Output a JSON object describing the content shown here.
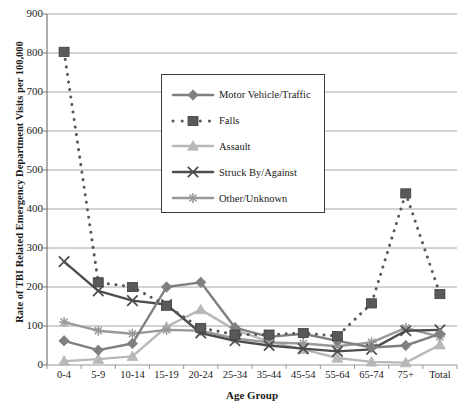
{
  "chart_data": {
    "type": "line",
    "title": "",
    "xlabel": "Age Group",
    "ylabel": "Rate of TBI Related Emergency Department Visits per 100,000",
    "ylim": [
      0,
      900
    ],
    "ytick_step": 100,
    "yticks": [
      "900",
      "800",
      "700",
      "600",
      "500",
      "400",
      "300",
      "200",
      "100",
      "0"
    ],
    "grid": "horizontal",
    "legend_position": "upper-center",
    "categories": [
      "0-4",
      "5-9",
      "10-14",
      "15-19",
      "20-24",
      "25-34",
      "35-44",
      "45-54",
      "55-64",
      "65-74",
      "75+",
      "Total"
    ],
    "series": [
      {
        "name": "Motor Vehicle/Traffic",
        "color": "#808080",
        "marker": "diamond",
        "dash": "solid",
        "values": [
          62,
          38,
          55,
          200,
          212,
          96,
          72,
          80,
          62,
          45,
          50,
          80
        ]
      },
      {
        "name": "Falls",
        "color": "#595959",
        "marker": "square",
        "dash": "dotted",
        "values": [
          803,
          212,
          200,
          152,
          95,
          78,
          78,
          82,
          74,
          158,
          440,
          182
        ]
      },
      {
        "name": "Assault",
        "color": "#b8b8b8",
        "marker": "triangle",
        "dash": "solid",
        "values": [
          10,
          15,
          22,
          98,
          142,
          90,
          60,
          40,
          18,
          8,
          6,
          52
        ]
      },
      {
        "name": "Struck By/Against",
        "color": "#4d4d4d",
        "marker": "x",
        "dash": "solid",
        "values": [
          265,
          190,
          165,
          155,
          82,
          62,
          50,
          42,
          35,
          40,
          88,
          90
        ]
      },
      {
        "name": "Other/Unknown",
        "color": "#999999",
        "marker": "star",
        "dash": "solid",
        "values": [
          110,
          88,
          80,
          90,
          88,
          68,
          58,
          55,
          48,
          58,
          95,
          72
        ]
      }
    ]
  },
  "axes": {
    "x_title": "Age Group",
    "y_title": "Rate of TBI Related Emergency Department Visits per 100,000"
  },
  "legend": {
    "items": [
      {
        "label": "Motor Vehicle/Traffic"
      },
      {
        "label": "Falls"
      },
      {
        "label": "Assault"
      },
      {
        "label": "Struck By/Against"
      },
      {
        "label": "Other/Unknown"
      }
    ]
  }
}
